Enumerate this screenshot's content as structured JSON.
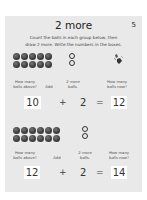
{
  "page": {
    "title": "2 more",
    "page_number": "5",
    "instructions_line1": "Count the balls in each group below, then",
    "instructions_line2": "draw 2 more. Write the numbers in the boxes."
  },
  "labels": {
    "how_many_above_1": "How many",
    "how_many_above_2": "balls above?",
    "add": "Add",
    "two_more_1": "2 more",
    "two_more_2": "balls.",
    "how_many_now_1": "How many",
    "how_many_now_2": "balls now?"
  },
  "problems": [
    {
      "balls_count": 10,
      "grid_cols": 5,
      "added_rings": 2,
      "has_drawing": true,
      "start": "10",
      "plus": "+",
      "add": "2",
      "equals": "=",
      "result": "12"
    },
    {
      "balls_count": 12,
      "grid_cols": 6,
      "added_rings": 2,
      "has_drawing": false,
      "start": "12",
      "plus": "+",
      "add": "2",
      "equals": "=",
      "result": "14"
    }
  ],
  "colors": {
    "card_bg": "#e9e9e9",
    "ball": "#3a3a3a",
    "box_bg": "#ffffff"
  }
}
